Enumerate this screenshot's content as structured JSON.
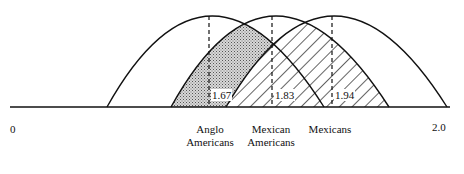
{
  "diagram": {
    "type": "overlapping-distributions",
    "axis": {
      "min_label": "0",
      "max_label": "2.0"
    },
    "groups": [
      {
        "name": "Anglo Americans",
        "label_lines": [
          "Anglo",
          "Americans"
        ],
        "mean": "1.67"
      },
      {
        "name": "Mexican Americans",
        "label_lines": [
          "Mexican",
          "Americans"
        ],
        "mean": "1.83"
      },
      {
        "name": "Mexicans",
        "label_lines": [
          "Mexicans"
        ],
        "mean": "1.94"
      }
    ],
    "fills": {
      "anglo_overlap": "dotted-gray",
      "mexican_american_overlap": "diagonal-hatch"
    }
  }
}
